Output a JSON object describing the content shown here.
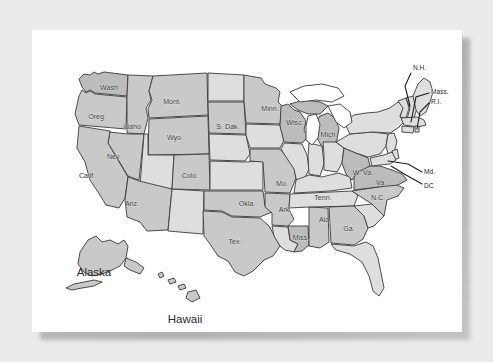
{
  "figure": {
    "type": "map",
    "background_color": "#ebebeb",
    "card_color": "#ffffff",
    "outline_color": "#3b3b3b",
    "fills": {
      "dark": "#bcbcbc",
      "mid": "#c9c9c9",
      "light": "#dedede",
      "water": "#ffffff"
    }
  },
  "labels": {
    "inset_titles": [
      {
        "name": "alaska",
        "text": "Alaska",
        "x": 62,
        "y": 243
      },
      {
        "name": "hawaii",
        "text": "Hawaii",
        "x": 153,
        "y": 290
      }
    ],
    "states": [
      {
        "name": "washington",
        "text": "Wash.",
        "x": 78,
        "y": 58
      },
      {
        "name": "oregon",
        "text": "Oreg.",
        "x": 65,
        "y": 87
      },
      {
        "name": "idaho",
        "text": "Idaho",
        "x": 100,
        "y": 97
      },
      {
        "name": "montana",
        "text": "Mont.",
        "x": 140,
        "y": 72
      },
      {
        "name": "wyoming",
        "text": "Wyo.",
        "x": 143,
        "y": 108
      },
      {
        "name": "nevada",
        "text": "Nev.",
        "x": 82,
        "y": 127
      },
      {
        "name": "california",
        "text": "Calif.",
        "x": 55,
        "y": 146
      },
      {
        "name": "arizona",
        "text": "Ariz.",
        "x": 100,
        "y": 174
      },
      {
        "name": "colorado",
        "text": "Colo.",
        "x": 158,
        "y": 146
      },
      {
        "name": "south-dakota",
        "text": "S. Dak.",
        "x": 196,
        "y": 97
      },
      {
        "name": "minnesota",
        "text": "Minn.",
        "x": 238,
        "y": 79
      },
      {
        "name": "wisconsin",
        "text": "Wisc.",
        "x": 263,
        "y": 93
      },
      {
        "name": "michigan",
        "text": "Mich.",
        "x": 297,
        "y": 105
      },
      {
        "name": "missouri",
        "text": "Mo.",
        "x": 250,
        "y": 154
      },
      {
        "name": "oklahoma",
        "text": "Okla.",
        "x": 215,
        "y": 174
      },
      {
        "name": "arkansas",
        "text": "Ark.",
        "x": 253,
        "y": 180
      },
      {
        "name": "texas",
        "text": "Tex.",
        "x": 203,
        "y": 212
      },
      {
        "name": "mississippi",
        "text": "Miss.",
        "x": 269,
        "y": 208
      },
      {
        "name": "alabama",
        "text": "Ala.",
        "x": 293,
        "y": 190
      },
      {
        "name": "georgia",
        "text": "Ga.",
        "x": 317,
        "y": 199
      },
      {
        "name": "tennessee",
        "text": "Tenn.",
        "x": 291,
        "y": 168
      },
      {
        "name": "west-virginia",
        "text": "W. Va.",
        "x": 331,
        "y": 143
      },
      {
        "name": "virginia",
        "text": "Va.",
        "x": 349,
        "y": 153
      },
      {
        "name": "north-carolina",
        "text": "N.C.",
        "x": 346,
        "y": 168
      }
    ],
    "leader_labels": [
      {
        "name": "new-hampshire",
        "text": "N.H.",
        "x": 381,
        "y": 38
      },
      {
        "name": "massachusetts",
        "text": "Mass.",
        "x": 399,
        "y": 62
      },
      {
        "name": "rhode-island",
        "text": "R.I.",
        "x": 399,
        "y": 72
      },
      {
        "name": "maryland",
        "text": "Md.",
        "x": 392,
        "y": 142
      },
      {
        "name": "washington-dc",
        "text": "DC",
        "x": 392,
        "y": 156
      }
    ]
  }
}
